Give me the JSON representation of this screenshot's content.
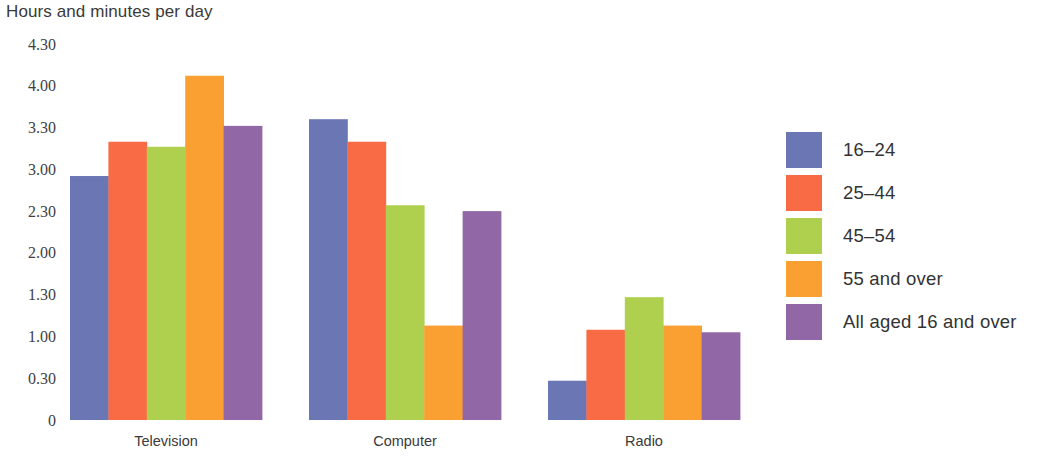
{
  "chart_data": {
    "type": "bar",
    "title": "Hours and minutes per day",
    "xlabel": "",
    "ylabel": "Hours and minutes per day",
    "grid": false,
    "legend_position": "right",
    "categories": [
      "Television",
      "Computer",
      "Radio"
    ],
    "y_tick_labels": [
      "4.30",
      "4.00",
      "3.30",
      "3.00",
      "2.30",
      "2.00",
      "1.30",
      "1.00",
      "0.30",
      "0"
    ],
    "y_tick_values": [
      4.5,
      4.0,
      3.5,
      3.0,
      2.5,
      2.0,
      1.5,
      1.0,
      0.5,
      0
    ],
    "ylim": [
      0,
      4.5
    ],
    "series": [
      {
        "name": "16–24",
        "color": "#6b76b5",
        "values": [
          2.92,
          3.6,
          0.47
        ],
        "value_labels": [
          "2.55",
          "3.36",
          "0.28"
        ]
      },
      {
        "name": "25–44",
        "color": "#f96b45",
        "values": [
          3.33,
          3.33,
          1.08
        ],
        "value_labels": [
          "3.20",
          "3.20",
          "1.05"
        ]
      },
      {
        "name": "45–54",
        "color": "#aed04e",
        "values": [
          3.27,
          2.57,
          1.47
        ],
        "value_labels": [
          "3.16",
          "2.34",
          "1.28"
        ]
      },
      {
        "name": "55 and over",
        "color": "#faa032",
        "values": [
          4.12,
          1.13,
          1.13
        ],
        "value_labels": [
          "4.07",
          "1.08",
          "1.08"
        ]
      },
      {
        "name": "All aged 16 and over",
        "color": "#9167a5",
        "values": [
          3.52,
          2.5,
          1.05
        ],
        "value_labels": [
          "3.31",
          "2.30",
          "1.03"
        ]
      }
    ]
  },
  "legend": {
    "items": [
      {
        "label": "16–24",
        "color": "#6b76b5"
      },
      {
        "label": "25–44",
        "color": "#f96b45"
      },
      {
        "label": "45–54",
        "color": "#aed04e"
      },
      {
        "label": "55 and over",
        "color": "#faa032"
      },
      {
        "label": "All aged 16 and over",
        "color": "#9167a5"
      }
    ]
  },
  "layout": {
    "plot_left": 70,
    "plot_right": 740,
    "plot_top": 44,
    "baseline_y": 420,
    "bar_width": 38.4,
    "group_gap": 46,
    "axis_color": "#4a4a4a"
  }
}
